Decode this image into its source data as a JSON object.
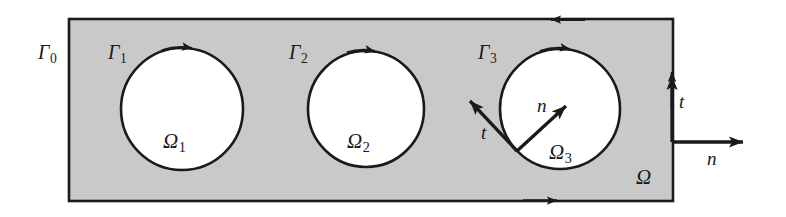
{
  "figure": {
    "domain_outer_label": "Γ",
    "labels": {
      "gamma0": {
        "base": "Γ",
        "sub": "0",
        "x": 38,
        "y": 42
      },
      "gamma1": {
        "base": "Γ",
        "sub": "1",
        "x": 108,
        "y": 42
      },
      "gamma2": {
        "base": "Γ",
        "sub": "2",
        "x": 289,
        "y": 42
      },
      "gamma3": {
        "base": "Γ",
        "sub": "3",
        "x": 478,
        "y": 42
      },
      "omega1": {
        "base": "Ω",
        "sub": "1",
        "x": 163,
        "y": 131
      },
      "omega2": {
        "base": "Ω",
        "sub": "2",
        "x": 347,
        "y": 131
      },
      "omega3": {
        "base": "Ω",
        "sub": "3",
        "x": 549,
        "y": 142
      },
      "omega": {
        "base": "Ω",
        "sub": "",
        "x": 636,
        "y": 167
      },
      "t_inner": {
        "base": "t",
        "sub": "",
        "x": 481,
        "y": 123
      },
      "n_inner": {
        "base": "n",
        "sub": "",
        "x": 537,
        "y": 96
      },
      "t_outer": {
        "base": "t",
        "sub": "",
        "x": 679,
        "y": 92
      },
      "n_outer": {
        "base": "n",
        "sub": "",
        "x": 707,
        "y": 149
      }
    },
    "geometry": {
      "rect": {
        "x": 69,
        "y": 19,
        "width": 604,
        "height": 182
      },
      "circles": [
        {
          "name": "omega-1",
          "cx": 182,
          "cy": 109,
          "r": 61
        },
        {
          "name": "omega-2",
          "cx": 366,
          "cy": 109,
          "r": 58
        },
        {
          "name": "omega-3",
          "cx": 560,
          "cy": 109,
          "r": 60
        }
      ],
      "vector_origin": {
        "x": 517,
        "y": 151
      },
      "n_inner_tip": {
        "x": 571,
        "y": 101
      },
      "t_inner_tip": {
        "x": 465,
        "y": 96
      },
      "n_outer": {
        "x1": 673,
        "y1": 142,
        "x2": 749,
        "y2": 142
      },
      "t_outer": {
        "x1": 673,
        "y1": 142,
        "x2": 673,
        "y2": 70
      }
    },
    "colors": {
      "shade": "#c9c9c9",
      "stroke": "#1a1a1a",
      "hole": "#fbfbfb",
      "page": "#ffffff"
    },
    "arrow_directions": {
      "top_edge": "left",
      "bottom_edge": "right",
      "right_edge": "up",
      "circle_top": "right"
    }
  },
  "ghosts": {
    "bottom_line": "░░░ ░░ ░░░░░ ░░ ░░░ ░░░░░ ░░░ ░░░░"
  }
}
